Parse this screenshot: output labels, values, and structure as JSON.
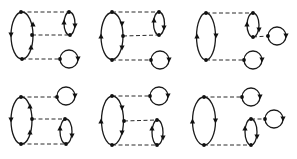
{
  "figure": {
    "colors": {
      "line": "#1a1a1a",
      "background": "#ffffff"
    }
  },
  "diagrams": [
    {
      "id": "diagram-1",
      "ellipses": [
        {
          "cx": 22,
          "cy": 35.5,
          "rx": 11,
          "ry": 23.5,
          "arrows": [
            {
              "x": 33,
              "y": 24,
              "dir": "up"
            },
            {
              "x": 11,
              "y": 35,
              "dir": "down"
            },
            {
              "x": 31,
              "y": 47,
              "dir": "up"
            }
          ]
        },
        {
          "cx": 69.5,
          "cy": 23.5,
          "rx": 5.5,
          "ry": 11.5,
          "arrows": [
            {
              "x": 64,
              "y": 22,
              "dir": "up"
            },
            {
              "x": 75,
              "y": 26,
              "dir": "down"
            }
          ]
        }
      ],
      "circles": [
        {
          "cx": 69,
          "cy": 59,
          "r": 9,
          "arrows": [
            {
              "x": 78,
              "y": 59,
              "dir": "down"
            }
          ]
        }
      ],
      "vertices": [
        [
          21,
          12
        ],
        [
          32,
          35
        ],
        [
          22,
          59
        ],
        [
          69,
          12
        ],
        [
          70,
          35
        ],
        [
          60,
          59
        ]
      ],
      "dashes": [
        [
          21,
          12,
          69,
          12
        ],
        [
          32,
          35,
          70,
          35
        ],
        [
          22,
          59,
          60,
          59
        ]
      ]
    },
    {
      "id": "diagram-2",
      "ellipses": [
        {
          "cx": 112,
          "cy": 36,
          "rx": 11,
          "ry": 23.5,
          "arrows": [
            {
              "x": 101,
              "y": 36,
              "dir": "up"
            },
            {
              "x": 122,
              "y": 24,
              "dir": "down"
            },
            {
              "x": 122,
              "y": 48,
              "dir": "down"
            }
          ]
        },
        {
          "cx": 159,
          "cy": 23.5,
          "rx": 5.5,
          "ry": 11.5,
          "arrows": [
            {
              "x": 154,
              "y": 20,
              "dir": "up"
            },
            {
              "x": 164,
              "y": 28,
              "dir": "down"
            }
          ]
        }
      ],
      "circles": [
        {
          "cx": 160,
          "cy": 60,
          "r": 9,
          "arrows": [
            {
              "x": 169,
              "y": 60,
              "dir": "down"
            }
          ]
        }
      ],
      "vertices": [
        [
          112,
          12
        ],
        [
          123,
          36
        ],
        [
          112,
          60
        ],
        [
          159,
          12
        ],
        [
          159,
          35
        ],
        [
          151,
          60
        ]
      ],
      "dashes": [
        [
          112,
          12,
          159,
          12
        ],
        [
          123,
          36,
          159,
          35
        ],
        [
          112,
          60,
          151,
          60
        ]
      ]
    },
    {
      "id": "diagram-3",
      "ellipses": [
        {
          "cx": 206,
          "cy": 36.5,
          "rx": 9.5,
          "ry": 23.5,
          "arrows": [
            {
              "x": 197,
              "y": 36,
              "dir": "up"
            },
            {
              "x": 216,
              "y": 36,
              "dir": "down"
            }
          ]
        },
        {
          "cx": 253,
          "cy": 25,
          "rx": 6,
          "ry": 12,
          "arrows": [
            {
              "x": 247,
              "y": 24,
              "dir": "up"
            },
            {
              "x": 259,
              "y": 30,
              "dir": "down"
            }
          ]
        }
      ],
      "circles": [
        {
          "cx": 277,
          "cy": 36,
          "r": 9,
          "arrows": [
            {
              "x": 286,
              "y": 36,
              "dir": "down"
            }
          ]
        },
        {
          "cx": 253,
          "cy": 60,
          "r": 9,
          "arrows": [
            {
              "x": 262,
              "y": 60,
              "dir": "down"
            }
          ]
        }
      ],
      "vertices": [
        [
          206,
          13
        ],
        [
          206,
          60
        ],
        [
          253,
          13
        ],
        [
          253,
          37
        ],
        [
          268,
          36
        ],
        [
          244,
          60
        ]
      ],
      "dashes": [
        [
          206,
          13,
          253,
          13
        ],
        [
          253,
          37,
          268,
          36
        ],
        [
          206,
          60,
          244,
          60
        ]
      ]
    },
    {
      "id": "diagram-4",
      "ellipses": [
        {
          "cx": 21.5,
          "cy": 120.5,
          "rx": 10.5,
          "ry": 23.5,
          "arrows": [
            {
              "x": 30,
              "y": 106,
              "dir": "up"
            },
            {
              "x": 11,
              "y": 120,
              "dir": "down"
            },
            {
              "x": 30,
              "y": 132,
              "dir": "up"
            }
          ]
        },
        {
          "cx": 66,
          "cy": 131.5,
          "rx": 6,
          "ry": 12.5,
          "arrows": [
            {
              "x": 60,
              "y": 128,
              "dir": "up"
            },
            {
              "x": 72,
              "y": 136,
              "dir": "down"
            }
          ]
        }
      ],
      "circles": [
        {
          "cx": 66,
          "cy": 96,
          "r": 9,
          "arrows": [
            {
              "x": 75,
              "y": 96,
              "dir": "down"
            }
          ]
        }
      ],
      "vertices": [
        [
          21,
          97
        ],
        [
          32,
          119
        ],
        [
          21,
          144
        ],
        [
          57,
          97
        ],
        [
          65,
          119
        ],
        [
          66,
          144
        ]
      ],
      "dashes": [
        [
          21,
          97,
          57,
          97
        ],
        [
          32,
          119,
          65,
          119
        ],
        [
          21,
          144,
          66,
          144
        ]
      ]
    },
    {
      "id": "diagram-5",
      "ellipses": [
        {
          "cx": 112.5,
          "cy": 120.5,
          "rx": 11,
          "ry": 24.5,
          "arrows": [
            {
              "x": 101,
              "y": 121,
              "dir": "up"
            },
            {
              "x": 122,
              "y": 108,
              "dir": "down"
            },
            {
              "x": 122,
              "y": 133,
              "dir": "down"
            }
          ]
        },
        {
          "cx": 157.5,
          "cy": 132.5,
          "rx": 5.5,
          "ry": 12.5,
          "arrows": [
            {
              "x": 152,
              "y": 128,
              "dir": "up"
            },
            {
              "x": 163,
              "y": 138,
              "dir": "down"
            }
          ]
        }
      ],
      "circles": [
        {
          "cx": 159,
          "cy": 96,
          "r": 9,
          "arrows": [
            {
              "x": 168,
              "y": 96,
              "dir": "down"
            }
          ]
        }
      ],
      "vertices": [
        [
          112,
          96
        ],
        [
          124,
          121
        ],
        [
          112,
          145
        ],
        [
          150,
          96
        ],
        [
          157,
          120
        ],
        [
          157,
          145
        ]
      ],
      "dashes": [
        [
          112,
          96,
          150,
          96
        ],
        [
          124,
          121,
          157,
          120
        ],
        [
          112,
          145,
          157,
          145
        ]
      ]
    },
    {
      "id": "diagram-6",
      "ellipses": [
        {
          "cx": 204,
          "cy": 121,
          "rx": 11.5,
          "ry": 24,
          "arrows": [
            {
              "x": 192.5,
              "y": 121,
              "dir": "up"
            },
            {
              "x": 215.5,
              "y": 121,
              "dir": "down"
            }
          ]
        },
        {
          "cx": 251,
          "cy": 132,
          "rx": 6,
          "ry": 13,
          "arrows": [
            {
              "x": 245,
              "y": 128,
              "dir": "up"
            },
            {
              "x": 257,
              "y": 137,
              "dir": "down"
            }
          ]
        }
      ],
      "circles": [
        {
          "cx": 251,
          "cy": 97,
          "r": 9,
          "arrows": [
            {
              "x": 260,
              "y": 97,
              "dir": "down"
            }
          ]
        },
        {
          "cx": 274,
          "cy": 119,
          "r": 9,
          "arrows": [
            {
              "x": 283,
              "y": 119,
              "dir": "down"
            }
          ]
        }
      ],
      "vertices": [
        [
          204,
          97
        ],
        [
          204,
          145
        ],
        [
          242,
          97
        ],
        [
          251,
          119
        ],
        [
          265,
          119
        ],
        [
          251,
          145
        ]
      ],
      "dashes": [
        [
          204,
          97,
          242,
          97
        ],
        [
          251,
          119,
          265,
          119
        ],
        [
          204,
          145,
          251,
          145
        ]
      ]
    }
  ]
}
